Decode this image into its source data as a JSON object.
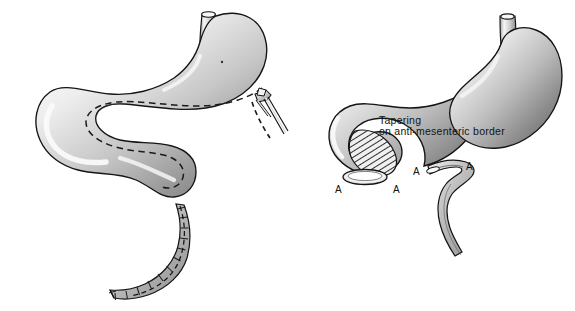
{
  "figure": {
    "title": "Tapering on anti-mesenteric border",
    "background_color": "#ffffff",
    "ink_color": "#121212",
    "style": "grayscale medical pen-and-ink illustration",
    "panel_count": 2
  },
  "annotations": {
    "caption": {
      "line1": "Tapering",
      "line2": "on anti-mesenteric border"
    },
    "markers": [
      {
        "label": "A",
        "panel": "right",
        "position": "lower-left of gastric pouch"
      },
      {
        "label": "A",
        "panel": "right",
        "position": "lower-right of gastric pouch"
      },
      {
        "label": "A",
        "panel": "right",
        "position": "proximal end of resected strip"
      },
      {
        "label": "A",
        "panel": "right",
        "position": "distal end of resected strip"
      }
    ]
  },
  "panels": [
    {
      "id": "left-panel",
      "name": "stomach-with-stapler",
      "description": "Stomach and elongated bowel loop with dashed resection line and surgical stapler applied",
      "elements": [
        {
          "name": "esophageal-stump",
          "type": "tube"
        },
        {
          "name": "gastric-body",
          "type": "organ"
        },
        {
          "name": "bowel-loop",
          "type": "organ"
        },
        {
          "name": "dashed-resection-line",
          "type": "dashed-path"
        },
        {
          "name": "surgical-stapler",
          "type": "instrument"
        },
        {
          "name": "resected-strip",
          "type": "specimen"
        }
      ]
    },
    {
      "id": "right-panel",
      "name": "tapered-stomach",
      "description": "Tapered gastric tube with hatched anti-mesenteric resection zone and excised strip",
      "elements": [
        {
          "name": "esophageal-stump",
          "type": "tube"
        },
        {
          "name": "gastric-body",
          "type": "organ"
        },
        {
          "name": "tapered-limb",
          "type": "organ"
        },
        {
          "name": "hatched-resection-zone",
          "type": "hatched-region"
        },
        {
          "name": "lumen-opening",
          "type": "opening"
        },
        {
          "name": "resected-strip",
          "type": "specimen"
        }
      ]
    }
  ],
  "colors": {
    "background": "#ffffff",
    "outline": "#121212",
    "tissue_light": "#f2f2f2",
    "tissue_mid": "#b6b6b6",
    "tissue_dark": "#6e6e6e",
    "highlight": "#fbfbfb",
    "hatch": "#2a2a2a"
  }
}
